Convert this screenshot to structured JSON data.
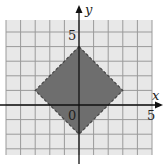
{
  "chart_data": {
    "type": "area",
    "title": "",
    "xlabel": "x",
    "ylabel": "y",
    "xlim": [
      -5,
      5
    ],
    "ylim": [
      -3.4,
      5.8
    ],
    "grid": true,
    "tick_labels": {
      "origin": "0",
      "x_mark": "5",
      "y_mark": "5"
    },
    "region": {
      "shape": "diamond",
      "boundary": "dashed",
      "fill": "#6e6e6e",
      "vertices": [
        [
          0,
          4
        ],
        [
          3,
          1
        ],
        [
          0,
          -2
        ],
        [
          -3,
          1
        ]
      ],
      "inequality": "|x| + |y - 1| < 3"
    }
  },
  "colors": {
    "grid_fill": "#e8e8e8",
    "grid_line": "#9a9a9a",
    "axis": "#111111",
    "region": "#6e6e6e"
  }
}
